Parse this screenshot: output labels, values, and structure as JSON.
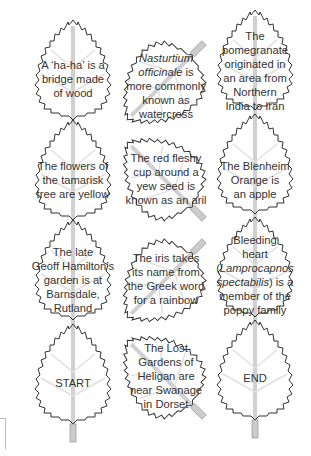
{
  "colors": {
    "outline": "#333333",
    "vein": "#d6d6d6",
    "stem": "#c8c8c8",
    "text": "#333333"
  },
  "leaves": [
    {
      "id": "r1c1",
      "text": "A ‘ha-ha’ is a bridge made of wood",
      "html": "A ‘ha-ha’ is a<br>bridge made<br>of wood"
    },
    {
      "id": "r1c2",
      "text": "Nasturtium officinale is more commonly known as watercress",
      "italic": "Nasturtium officinale"
    },
    {
      "id": "r1c3",
      "text": "The pomegranate originated in an area from Northern India to Iran"
    },
    {
      "id": "r2c1",
      "text": "The flowers of the tamarisk tree are yellow"
    },
    {
      "id": "r2c2",
      "text": "The red fleshy cup around a yew seed is known as an aril"
    },
    {
      "id": "r2c3",
      "text": "The Blenheim Orange is an apple"
    },
    {
      "id": "r3c1",
      "text": "The late Geoff Hamilton’s garden is at Barnsdale, Rutland"
    },
    {
      "id": "r3c2",
      "text": "The iris takes its name from the Greek word for a rainbow"
    },
    {
      "id": "r3c3",
      "text": "Bleeding heart (Lamprocapnos spectabilis) is a member of the poppy family",
      "italic": "Lamprocapnos spectabilis"
    },
    {
      "id": "r4c1",
      "text": "START"
    },
    {
      "id": "r4c2",
      "text": "The Lost Gardens of Heligan are near Swanage in Dorset"
    },
    {
      "id": "r4c3",
      "text": "END"
    }
  ],
  "lines": {
    "r1c1": [
      "A ‘ha-ha’ is a",
      "bridge made",
      "of wood"
    ],
    "r1c2": [
      "Nasturtium",
      "officinale is",
      "more commonly",
      "known as",
      "watercress"
    ],
    "r1c3": [
      "The",
      "pomegranate",
      "originated in",
      "an area from",
      "Northern",
      "India to Iran"
    ],
    "r2c1": [
      "The flowers of",
      "the tamarisk",
      "tree are yellow"
    ],
    "r2c2": [
      "The red fleshy",
      "cup around a",
      "yew seed is",
      "known as an aril"
    ],
    "r2c3": [
      "The Blenheim",
      "Orange is",
      "an apple"
    ],
    "r3c1": [
      "The late",
      "Geoff Hamilton’s",
      "garden is at",
      "Barnsdale,",
      "Rutland"
    ],
    "r3c2": [
      "The iris takes",
      "its name from",
      "the Greek word",
      "for a rainbow"
    ],
    "r3c3": [
      "Bleeding",
      "heart",
      "(Lamprocapnos",
      "spectabilis) is a",
      "member of the",
      "poppy family"
    ],
    "r4c1": [
      "START"
    ],
    "r4c2": [
      "The Lost",
      "Gardens of",
      "Heligan are",
      "near Swanage",
      "in Dorset"
    ],
    "r4c3": [
      "END"
    ]
  }
}
